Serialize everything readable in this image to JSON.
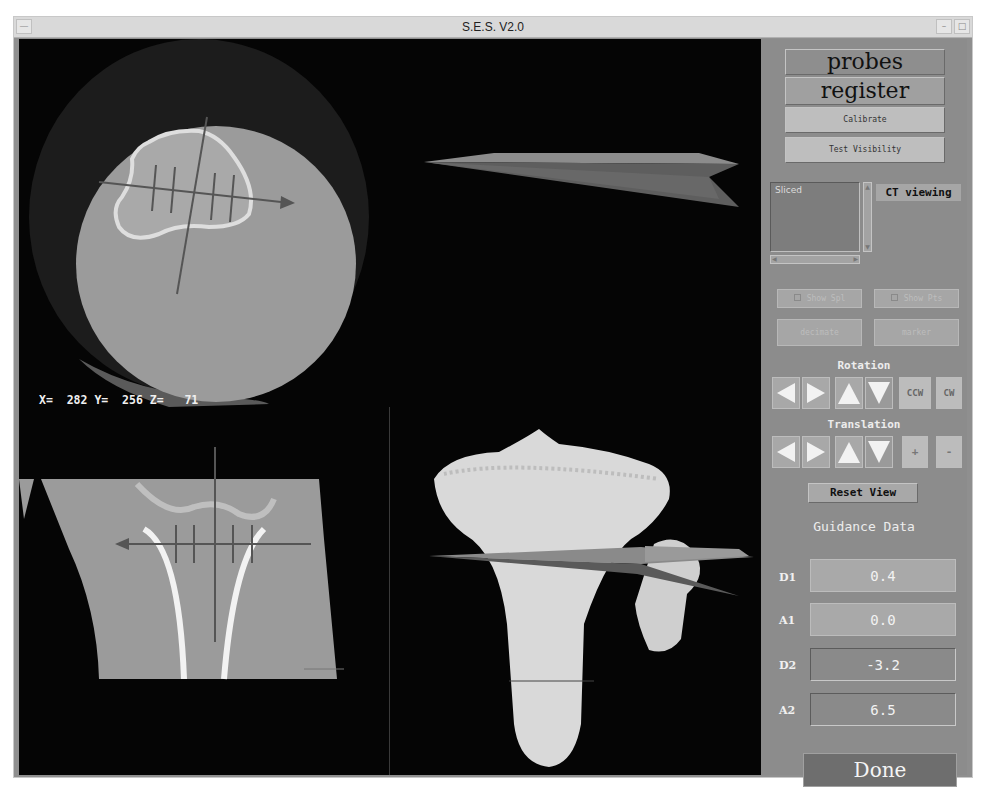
{
  "window": {
    "title": "S.E.S. V2.0"
  },
  "viewport": {
    "axial_view": {
      "coords_label": "X=  282 Y=  256 Z=   71",
      "x": 282,
      "y": 256,
      "z": 71
    },
    "coronal_view": {},
    "probe_view": {},
    "model_view": {}
  },
  "panel": {
    "buttons": {
      "probes": "probes",
      "register": "register",
      "calibrate": "Calibrate",
      "test_visibility": "Test Visibility"
    },
    "list": {
      "items": [
        "Sliced"
      ]
    },
    "ct_viewing_label": "CT viewing",
    "disabled": {
      "show_a": "Show Spl",
      "show_b": "Show Pts",
      "btn_a": "decimate",
      "btn_b": "marker"
    },
    "rotation": {
      "label": "Rotation",
      "ccw": "CCW",
      "cw": "CW"
    },
    "translation": {
      "label": "Translation",
      "plus": "+",
      "minus": "-"
    },
    "reset_view": "Reset View",
    "guidance": {
      "title": "Guidance Data",
      "rows": [
        {
          "label": "D1",
          "value": "0.4"
        },
        {
          "label": "A1",
          "value": "0.0"
        },
        {
          "label": "D2",
          "value": "-3.2"
        },
        {
          "label": "A2",
          "value": "6.5"
        }
      ]
    },
    "done": "Done"
  },
  "colors": {
    "panel_bg": "#8c8c8c",
    "viewport_bg": "#050505",
    "done_bg": "#6e6e6e",
    "bone": "#d8d8d8"
  }
}
